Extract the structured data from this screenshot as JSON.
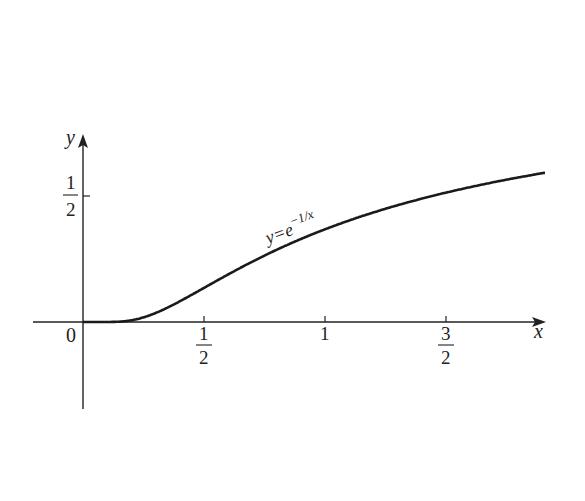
{
  "chart_data": {
    "type": "line",
    "title": "",
    "xlabel": "x",
    "ylabel": "y",
    "function": "y = e^{-1/x}",
    "curve_label": "y=e^{-1/x}",
    "x_ticks": [
      {
        "value": 0.5,
        "label_num": "1",
        "label_den": "2"
      },
      {
        "value": 1,
        "label": "1"
      },
      {
        "value": 1.5,
        "label_num": "3",
        "label_den": "2"
      }
    ],
    "y_ticks": [
      {
        "value": 0.5,
        "label_num": "1",
        "label_den": "2"
      }
    ],
    "origin_label": "0",
    "xlim": [
      -0.2,
      1.92
    ],
    "ylim": [
      -0.35,
      0.75
    ],
    "grid": false,
    "series": [
      {
        "name": "y=e^{-1/x}",
        "x": [
          0,
          0.1,
          0.2,
          0.3,
          0.4,
          0.5,
          0.6,
          0.7,
          0.8,
          0.9,
          1.0,
          1.2,
          1.4,
          1.6,
          1.8,
          1.9
        ],
        "values": [
          0,
          5e-05,
          0.0067,
          0.0357,
          0.0821,
          0.1353,
          0.1889,
          0.2397,
          0.2865,
          0.3292,
          0.3679,
          0.4346,
          0.4895,
          0.5353,
          0.5738,
          0.5908
        ]
      }
    ]
  }
}
